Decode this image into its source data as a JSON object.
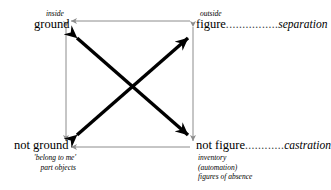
{
  "diagram": {
    "colors": {
      "text": "#000000",
      "diagonal_arrow": "#000000",
      "axis_arrow": "#8c8c8c",
      "dots": "#444444",
      "background": "#ffffff"
    },
    "nodes": [
      {
        "id": "ground",
        "term": "ground",
        "qualifier": "inside",
        "relation_label": "",
        "relation_dots": "",
        "gloss": []
      },
      {
        "id": "figure",
        "term": "figure",
        "qualifier": "outside",
        "relation_label": "separation",
        "relation_dots": "................",
        "gloss": []
      },
      {
        "id": "not-ground",
        "term": "not ground",
        "qualifier": "",
        "relation_label": "",
        "relation_dots": "",
        "gloss": [
          "'belong to me'",
          "part objects"
        ]
      },
      {
        "id": "not-figure",
        "term": "not figure",
        "qualifier": "",
        "relation_label": "castration",
        "relation_dots": "............",
        "gloss": [
          "inventory",
          "(automation)",
          "figures of absence"
        ]
      }
    ],
    "edges": [
      {
        "id": "top-horizontal",
        "from": "figure",
        "to": "ground",
        "style": "thin-gray",
        "arrows": "single"
      },
      {
        "id": "bottom-horizontal",
        "from": "not-figure",
        "to": "not-ground",
        "style": "thin-gray",
        "arrows": "single"
      },
      {
        "id": "left-vertical",
        "from": "ground",
        "to": "not-ground",
        "style": "thin-gray",
        "arrows": "double"
      },
      {
        "id": "right-vertical",
        "from": "figure",
        "to": "not-figure",
        "style": "thin-gray",
        "arrows": "double"
      },
      {
        "id": "diagonal-nw-se",
        "from": "ground",
        "to": "not-figure",
        "style": "thick-black",
        "arrows": "double"
      },
      {
        "id": "diagonal-sw-ne",
        "from": "not-ground",
        "to": "figure",
        "style": "thick-black",
        "arrows": "double"
      }
    ]
  }
}
